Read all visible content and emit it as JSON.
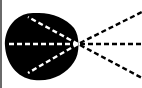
{
  "diagram": {
    "colors": {
      "background": "#ffffff",
      "blob": "#000000",
      "inner_dash": "#ffffff",
      "outer_dash": "#000000",
      "edge": "#6a6a6a"
    },
    "focal_point": [
      78,
      44
    ],
    "inner_rays": [
      [
        26,
        16
      ],
      [
        6,
        44
      ],
      [
        26,
        74
      ]
    ],
    "outer_rays": [
      [
        142,
        12
      ],
      [
        142,
        44
      ],
      [
        142,
        78
      ]
    ]
  }
}
